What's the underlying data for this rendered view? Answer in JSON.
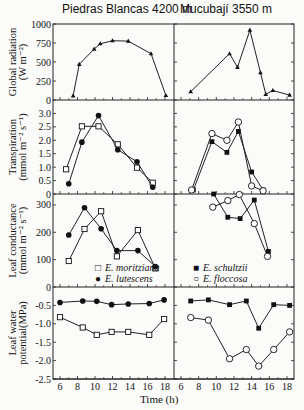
{
  "headers": {
    "left_site": "Piedras Blancas  4200 m",
    "right_site": "Mucubají  3550 m"
  },
  "x_axis": {
    "label": "Time (h)",
    "ticks": [
      6,
      8,
      10,
      12,
      14,
      16,
      18
    ]
  },
  "legend": {
    "left": [
      {
        "marker": "open-square",
        "glyph": "□",
        "label": "E. moritziana"
      },
      {
        "marker": "filled-circle",
        "glyph": "●",
        "label": "E. lutescens"
      }
    ],
    "right": [
      {
        "marker": "filled-square",
        "glyph": "■",
        "label": "E. schultzii"
      },
      {
        "marker": "open-circle",
        "glyph": "○",
        "label": "E. floccosa"
      }
    ]
  },
  "chart_data": [
    {
      "type": "line",
      "title": "Global radiation",
      "ylabel": "Global radiation (W m-2)",
      "yticks": [
        0,
        250,
        500,
        750,
        1000
      ],
      "ylim": [
        0,
        1000
      ],
      "panels": {
        "Piedras Blancas 4200 m": {
          "series": [
            {
              "name": "Radiation",
              "marker": "filled-triangle",
              "x": [
                7.5,
                8.2,
                9.9,
                10.6,
                12.0,
                13.8,
                16.4,
                18.1
              ],
              "y": [
                55,
                470,
                670,
                740,
                780,
                775,
                610,
                60
              ]
            }
          ]
        },
        "Mucubají 3550 m": {
          "series": [
            {
              "name": "Radiation",
              "marker": "filled-triangle",
              "x": [
                7.1,
                11.5,
                12.4,
                13.8,
                15.0,
                15.6,
                16.4,
                18.3
              ],
              "y": [
                110,
                610,
                430,
                920,
                360,
                75,
                125,
                65
              ]
            }
          ]
        }
      }
    },
    {
      "type": "line",
      "title": "Transpiration",
      "ylabel": "Transpiration (mmol m-2 s-1)",
      "yticks": [
        0,
        0.5,
        1.0,
        1.5,
        2.0,
        2.5,
        3.0
      ],
      "ylim": [
        0,
        3.5
      ],
      "panels": {
        "Piedras Blancas 4200 m": {
          "series": [
            {
              "name": "E. moritziana",
              "marker": "open-square",
              "x": [
                6.7,
                8.5,
                10.4,
                12.6,
                14.8,
                16.6
              ],
              "y": [
                0.92,
                2.52,
                2.52,
                1.85,
                0.98,
                0.42
              ]
            },
            {
              "name": "E. lutescens",
              "marker": "filled-circle",
              "x": [
                7.0,
                8.5,
                10.4,
                12.6,
                14.8,
                16.6
              ],
              "y": [
                0.38,
                1.93,
                2.92,
                1.65,
                1.2,
                0.25
              ]
            }
          ]
        },
        "Mucubají 3550 m": {
          "series": [
            {
              "name": "E. schultzii",
              "marker": "filled-square",
              "x": [
                7.4,
                9.5,
                11.2,
                12.5,
                14.0,
                15.3
              ],
              "y": [
                0.15,
                1.95,
                1.55,
                2.33,
                0.82,
                0.15
              ]
            },
            {
              "name": "E. floccosa",
              "marker": "open-circle",
              "x": [
                7.2,
                9.5,
                11.2,
                12.5,
                14.0,
                15.3
              ],
              "y": [
                0.15,
                2.25,
                2.0,
                2.68,
                0.3,
                0.12
              ]
            }
          ]
        }
      }
    },
    {
      "type": "line",
      "title": "Leaf conductance",
      "ylabel": "Leaf conductance (mmol m-2 s-1)",
      "yticks": [
        0,
        100,
        200,
        300
      ],
      "ylim": [
        0,
        340
      ],
      "panels": {
        "Piedras Blancas 4200 m": {
          "series": [
            {
              "name": "E. moritziana",
              "marker": "open-square",
              "x": [
                7.0,
                8.8,
                10.7,
                12.5,
                14.9,
                16.9
              ],
              "y": [
                95,
                212,
                277,
                112,
                208,
                68
              ]
            },
            {
              "name": "E. lutescens",
              "marker": "filled-circle",
              "x": [
                7.0,
                8.8,
                10.7,
                12.5,
                14.9,
                16.9
              ],
              "y": [
                190,
                290,
                213,
                133,
                133,
                75
              ]
            }
          ]
        },
        "Mucubají 3550 m": {
          "series": [
            {
              "name": "E. schultzii",
              "marker": "filled-square",
              "x": [
                9.7,
                11.3,
                12.7,
                14.3,
                15.9
              ],
              "y": [
                340,
                255,
                250,
                318,
                130
              ]
            },
            {
              "name": "E. floccosa",
              "marker": "open-circle",
              "x": [
                9.6,
                11.3,
                12.6,
                14.3,
                15.8
              ],
              "y": [
                292,
                316,
                338,
                232,
                112
              ]
            }
          ]
        }
      }
    },
    {
      "type": "line",
      "title": "Leaf water potential",
      "ylabel": "Leaf water potential (MPa)",
      "yticks": [
        -2.5,
        -2.0,
        -1.5,
        -1.0,
        -0.5
      ],
      "ylim": [
        -2.5,
        0
      ],
      "panels": {
        "Piedras Blancas 4200 m": {
          "series": [
            {
              "name": "E. lutescens",
              "marker": "filled-circle",
              "x": [
                6.0,
                8.6,
                10.2,
                11.9,
                13.8,
                16.2,
                17.9
              ],
              "y": [
                -0.42,
                -0.38,
                -0.39,
                -0.48,
                -0.46,
                -0.45,
                -0.35
              ]
            },
            {
              "name": "E. moritziana",
              "marker": "open-square",
              "x": [
                6.0,
                8.6,
                10.2,
                11.9,
                13.8,
                16.2,
                17.9
              ],
              "y": [
                -0.82,
                -1.1,
                -1.3,
                -1.22,
                -1.22,
                -1.3,
                -0.87
              ]
            }
          ]
        },
        "Mucubají 3550 m": {
          "series": [
            {
              "name": "E. schultzii",
              "marker": "filled-square",
              "x": [
                7.1,
                9.1,
                11.5,
                13.4,
                14.8,
                16.5,
                18.3
              ],
              "y": [
                -0.38,
                -0.35,
                -0.48,
                -0.38,
                -1.12,
                -0.48,
                -0.5
              ]
            },
            {
              "name": "E. floccosa",
              "marker": "open-circle",
              "x": [
                7.1,
                9.1,
                11.5,
                13.4,
                14.8,
                16.5,
                18.3
              ],
              "y": [
                -0.83,
                -0.9,
                -1.95,
                -1.7,
                -2.15,
                -1.7,
                -1.22
              ]
            }
          ]
        }
      }
    }
  ]
}
